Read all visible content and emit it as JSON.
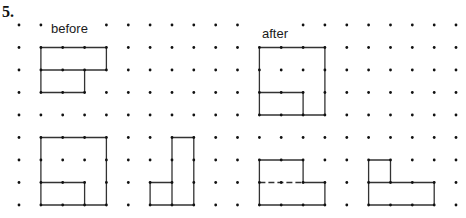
{
  "problem_number": "5.",
  "labels": {
    "before": "before",
    "after": "after"
  },
  "grid": {
    "cols": 21,
    "rows": 9,
    "origin_x": 19,
    "origin_y": 25,
    "spacing_x": 21.85,
    "spacing_y": 22.5,
    "dot_color": "#111111",
    "hidden_dots": [
      [
        2,
        0
      ],
      [
        3,
        0
      ],
      [
        11,
        0
      ],
      [
        12,
        0
      ]
    ]
  },
  "line_color": "#333333",
  "figures": [
    {
      "name": "before-figure",
      "segments": [
        {
          "points": [
            [
              1,
              1
            ],
            [
              4,
              1
            ],
            [
              4,
              2
            ],
            [
              1,
              2
            ],
            [
              1,
              1
            ]
          ]
        },
        {
          "points": [
            [
              1,
              2
            ],
            [
              1,
              3
            ],
            [
              3,
              3
            ],
            [
              3,
              2
            ]
          ]
        }
      ]
    },
    {
      "name": "after-figure",
      "segments": [
        {
          "points": [
            [
              11,
              1
            ],
            [
              14,
              1
            ],
            [
              14,
              4
            ],
            [
              11,
              4
            ],
            [
              11,
              1
            ]
          ]
        },
        {
          "points": [
            [
              11,
              3
            ],
            [
              13,
              3
            ],
            [
              13,
              4
            ]
          ]
        }
      ]
    },
    {
      "name": "option-figure-a",
      "segments": [
        {
          "points": [
            [
              1,
              5
            ],
            [
              4,
              5
            ],
            [
              4,
              8
            ],
            [
              1,
              8
            ],
            [
              1,
              5
            ]
          ]
        },
        {
          "points": [
            [
              1,
              7
            ],
            [
              3,
              7
            ],
            [
              3,
              8
            ]
          ]
        }
      ]
    },
    {
      "name": "option-figure-b",
      "segments": [
        {
          "points": [
            [
              7,
              5
            ],
            [
              8,
              5
            ],
            [
              8,
              8
            ],
            [
              7,
              8
            ],
            [
              7,
              5
            ]
          ]
        },
        {
          "points": [
            [
              7,
              7
            ],
            [
              6,
              7
            ],
            [
              6,
              8
            ],
            [
              7,
              8
            ]
          ]
        }
      ]
    },
    {
      "name": "option-figure-c",
      "segments": [
        {
          "points": [
            [
              11,
              7
            ],
            [
              11,
              6
            ],
            [
              13,
              6
            ],
            [
              13,
              7
            ],
            [
              14,
              7
            ],
            [
              14,
              8
            ],
            [
              11,
              8
            ],
            [
              11,
              7
            ]
          ]
        },
        {
          "points": [
            [
              11,
              7
            ],
            [
              13,
              7
            ]
          ],
          "dashed": true
        }
      ]
    },
    {
      "name": "option-figure-d",
      "segments": [
        {
          "points": [
            [
              16,
              7
            ],
            [
              16,
              6
            ],
            [
              17,
              6
            ],
            [
              17,
              7
            ]
          ]
        },
        {
          "points": [
            [
              16,
              7
            ],
            [
              19,
              7
            ],
            [
              19,
              8
            ],
            [
              16,
              8
            ],
            [
              16,
              7
            ]
          ]
        }
      ]
    }
  ]
}
